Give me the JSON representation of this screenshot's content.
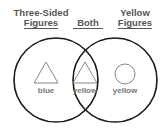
{
  "diagram": {
    "type": "venn",
    "sets": [
      {
        "id": "left",
        "title_line1": "Three-Sided",
        "title_line2": "Figures"
      },
      {
        "id": "right",
        "title_line1": "Yellow",
        "title_line2": "Figures"
      }
    ],
    "intersection_title": "Both",
    "regions": [
      {
        "region": "left-only",
        "shape": "triangle",
        "label": "blue"
      },
      {
        "region": "both",
        "shape": "triangle",
        "label": "yellow"
      },
      {
        "region": "right-only",
        "shape": "circle",
        "label": "yellow"
      }
    ],
    "colors": {
      "circle_stroke": "#1a1a1a",
      "shape_stroke": "#888888",
      "text": "#555555"
    }
  }
}
